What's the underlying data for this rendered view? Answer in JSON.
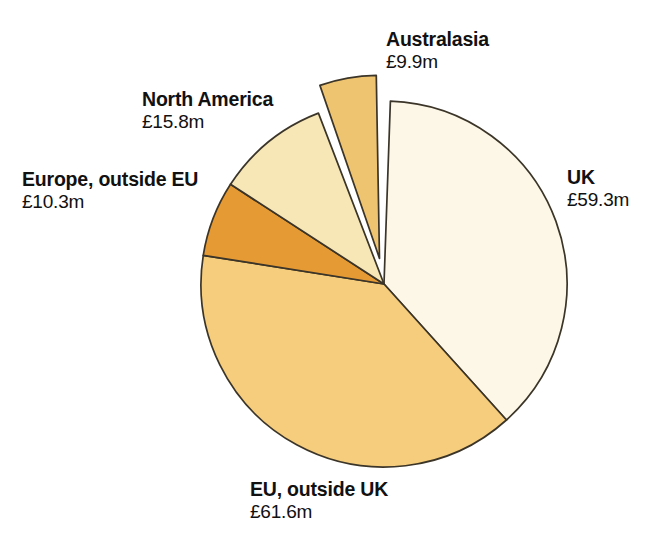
{
  "chart_data": {
    "type": "pie",
    "title": "",
    "subtitle": "",
    "xlabel": "",
    "ylabel": "",
    "units": "£m",
    "value_prefix": "£",
    "value_suffix": "m",
    "legend_position": "none",
    "labels_position": "outside-callout",
    "grid": false,
    "total": 156.9,
    "start_angle_deg": 0,
    "direction": "clockwise",
    "categories": [
      "UK",
      "EU, outside UK",
      "Europe, outside EU",
      "North America",
      "Australasia"
    ],
    "values": [
      59.3,
      61.6,
      10.3,
      15.8,
      9.9
    ],
    "value_labels": [
      "£59.3m",
      "£61.6m",
      "£10.3m",
      "£15.8m",
      "£9.9m"
    ],
    "colors": [
      "#FCF7E6",
      "#F5CD7C",
      "#E59A33",
      "#F7E7B6",
      "#EFC470"
    ],
    "exploded": [
      false,
      false,
      false,
      false,
      true
    ],
    "slices": [
      {
        "name": "UK",
        "value": 59.3,
        "value_label": "£59.3m",
        "color": "#FCF7E6",
        "start_deg": 2,
        "end_deg": 138,
        "exploded": false,
        "label_side": "right"
      },
      {
        "name": "EU, outside UK",
        "value": 61.6,
        "value_label": "£61.6m",
        "color": "#F5CD7C",
        "start_deg": 138,
        "end_deg": 279,
        "exploded": false,
        "label_side": "bottom"
      },
      {
        "name": "Europe, outside EU",
        "value": 10.3,
        "value_label": "£10.3m",
        "color": "#E59A33",
        "start_deg": 279,
        "end_deg": 303,
        "exploded": false,
        "label_side": "left"
      },
      {
        "name": "North America",
        "value": 15.8,
        "value_label": "£15.8m",
        "color": "#F7E7B6",
        "start_deg": 303,
        "end_deg": 339,
        "exploded": false,
        "label_side": "upper-left"
      },
      {
        "name": "Australasia",
        "value": 9.9,
        "value_label": "£9.9m",
        "color": "#EFC470",
        "start_deg": 341,
        "end_deg": 359,
        "exploded": true,
        "label_side": "top-right"
      }
    ],
    "geometry": {
      "center_x": 384,
      "center_y": 284,
      "radius": 183,
      "explode_offset": 26
    },
    "stroke_color": "#3b3428"
  },
  "labels": {
    "australasia": {
      "name": "Australasia",
      "value": "£9.9m"
    },
    "north_america": {
      "name": "North America",
      "value": "£15.8m"
    },
    "europe_ex_eu": {
      "name": "Europe, outside EU",
      "value": "£10.3m"
    },
    "uk": {
      "name": "UK",
      "value": "£59.3m"
    },
    "eu_ex_uk": {
      "name": "EU, outside UK",
      "value": "£61.6m"
    }
  },
  "background_bleed": [
    {
      "text": "was only two",
      "x": 420,
      "y": 150
    },
    {
      "text": "the figure",
      "x": 430,
      "y": 182
    },
    {
      "text": "and a number",
      "x": 408,
      "y": 214
    },
    {
      "text": "was the",
      "x": 440,
      "y": 246
    },
    {
      "text": "the export market",
      "x": 396,
      "y": 278
    },
    {
      "text": "had been",
      "x": 432,
      "y": 310
    },
    {
      "text": "he gave",
      "x": 446,
      "y": 342
    }
  ]
}
